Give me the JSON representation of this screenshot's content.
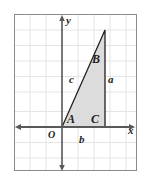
{
  "figure": {
    "frame": {
      "x": 14,
      "y": 14,
      "width": 123,
      "height": 157,
      "border_color": "#808080",
      "background_color": "#ffffff"
    },
    "grid": {
      "visible": true,
      "spacing_px": 15.5,
      "color": "#e2e2e2",
      "columns": 8,
      "rows": 10
    },
    "axes": {
      "color": "#58595b",
      "x_axis": {
        "label": "x",
        "label_x": 129,
        "label_y": 132,
        "y_px": 127,
        "arrows": "both"
      },
      "y_axis": {
        "label": "y",
        "label_x": 66,
        "label_y": 23,
        "x_px": 62,
        "arrows": "both"
      },
      "origin": {
        "label": "O",
        "label_x": 48,
        "label_y": 138
      }
    },
    "triangle": {
      "fill_color": "#dcdcdc",
      "stroke_color": "#231f20",
      "vertices": [
        {
          "name": "A",
          "x": 62,
          "y": 127,
          "label": "A",
          "label_x": 68,
          "label_y": 121
        },
        {
          "name": "C",
          "x": 105,
          "y": 127,
          "label": "C",
          "label_x": 92,
          "label_y": 121
        },
        {
          "name": "B",
          "x": 105,
          "y": 30,
          "label": "B",
          "label_x": 93,
          "label_y": 62
        }
      ],
      "sides": [
        {
          "name": "a",
          "label": "a",
          "label_x": 108,
          "label_y": 82,
          "opposite_vertex": "A"
        },
        {
          "name": "b",
          "label": "b",
          "label_x": 79,
          "label_y": 141,
          "opposite_vertex": "B"
        },
        {
          "name": "c",
          "label": "c",
          "label_x": 69,
          "label_y": 82,
          "opposite_vertex": "C"
        }
      ]
    }
  }
}
